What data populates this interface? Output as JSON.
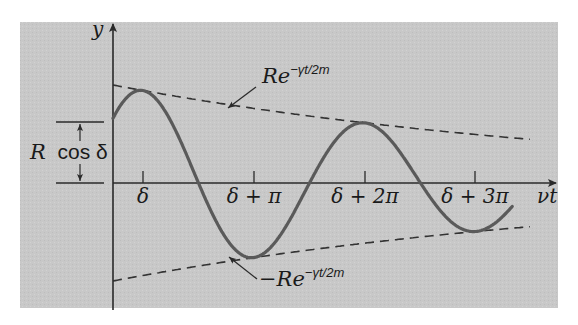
{
  "chart_data": {
    "type": "line",
    "title": "",
    "xlabel": "νt",
    "ylabel": "y",
    "x_ticks": [
      {
        "label": "δ",
        "x": 143
      },
      {
        "label": "δ + π",
        "x": 254
      },
      {
        "label": "δ + 2π",
        "x": 365
      },
      {
        "label": "δ + 3π",
        "x": 475
      }
    ],
    "grid": false,
    "legend": null,
    "series": [
      {
        "name": "y = R e^{-γt/2m} cos(νt − δ)",
        "style": "solid",
        "description": "Damped oscillation starting at R cos δ, extrema at δ, δ+π, δ+2π, δ+3π"
      },
      {
        "name": "Re^{-γt/2m}",
        "style": "dashed",
        "description": "Upper decaying envelope"
      },
      {
        "name": "−Re^{-γt/2m}",
        "style": "dashed",
        "description": "Lower decaying envelope"
      }
    ],
    "annotations": [
      {
        "text": "Re^{-γt/2m}",
        "points_to": "upper envelope"
      },
      {
        "text": "−Re^{-γt/2m}",
        "points_to": "lower envelope"
      },
      {
        "text": "R cos δ",
        "meaning": "initial displacement at t = 0 (dimension arrow)"
      }
    ],
    "approx_points": {
      "start": {
        "x": 0,
        "y": "R cos δ"
      },
      "peak_1": {
        "x": "δ",
        "y_rel": 0.9
      },
      "trough_1": {
        "x": "δ + π",
        "y_rel": -0.65
      },
      "peak_2": {
        "x": "δ + 2π",
        "y_rel": 0.51
      },
      "trough_2": {
        "x": "δ + 3π",
        "y_rel": -0.39
      }
    }
  },
  "plot": {
    "panel": {
      "x": 20,
      "y": 22,
      "w": 538,
      "h": 286,
      "color": "#c9c9c9"
    },
    "origin": {
      "x": 113,
      "y": 183
    },
    "px_per_rad": 35.33,
    "R_px": 98,
    "delta_rad": 0.85,
    "decay_per_rad": 0.0685,
    "curve_end_rad": 11.3,
    "envelope_end_px": 530,
    "curve_color": "#5a5a5a",
    "axis_color": "#2a2a2a",
    "envelope_color": "#333333"
  },
  "labels": {
    "y_axis": "y",
    "x_axis": "νt",
    "upper_envelope_base": "Re",
    "upper_envelope_exp": "−γt/2m",
    "lower_envelope_base": "−Re",
    "lower_envelope_exp": "−γt/2m",
    "rcos_R": "R",
    "rcos_rest": "cos δ",
    "tick_0": "δ",
    "tick_1": "δ + π",
    "tick_2": "δ + 2π",
    "tick_3": "δ + 3π"
  }
}
